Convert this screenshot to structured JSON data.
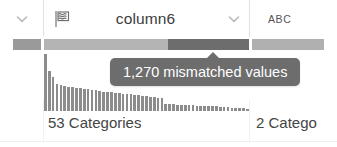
{
  "header": {
    "prev_column": {
      "chevron_icon": "chevron-down-icon"
    },
    "main_column": {
      "type_icon": "flag-text-icon",
      "title": "column6",
      "chevron_icon": "chevron-down-icon"
    },
    "next_column": {
      "type_label": "ABC"
    }
  },
  "quality": {
    "colors": {
      "valid": "#9a9a9a",
      "valid_light": "#b4b4b4",
      "mismatched": "#6d6d6d",
      "neutral": "#a8a8a8"
    },
    "segments": [
      {
        "name": "prev-column-quality",
        "label": "valid",
        "x": 13,
        "width": 28,
        "color": "#9a9a9a"
      },
      {
        "name": "main-column-valid",
        "label": "valid",
        "x": 44,
        "width": 124,
        "color": "#b4b4b4"
      },
      {
        "name": "main-column-mismatched",
        "label": "mismatched",
        "x": 168,
        "width": 81,
        "color": "#6d6d6d"
      },
      {
        "name": "next-column-quality",
        "label": "valid",
        "x": 252,
        "width": 72,
        "color": "#b0b0b0"
      }
    ]
  },
  "tooltip": {
    "text": "1,270 mismatched values"
  },
  "footer": {
    "main_categories": "53 Categories",
    "next_categories": "2 Catego"
  },
  "chart_data": {
    "type": "bar",
    "xlabel": "",
    "ylabel": "count",
    "categories": [
      "c1",
      "c2",
      "c3",
      "c4",
      "c5",
      "c6",
      "c7",
      "c8",
      "c9",
      "c10",
      "c11",
      "c12",
      "c13",
      "c14",
      "c15",
      "c16",
      "c17",
      "c18",
      "c19",
      "c20",
      "c21",
      "c22",
      "c23",
      "c24",
      "c25",
      "c26",
      "c27",
      "c28",
      "c29",
      "c30",
      "c31",
      "c32",
      "c33",
      "c34",
      "c35",
      "c36",
      "c37",
      "c38",
      "c39",
      "c40",
      "c41",
      "c42",
      "c43",
      "c44",
      "c45",
      "c46",
      "c47",
      "c48",
      "c49",
      "c50",
      "c51",
      "c52",
      "c53"
    ],
    "values": [
      100,
      70,
      60,
      48,
      46,
      44,
      43,
      42,
      41,
      40,
      39,
      38,
      37,
      36,
      35,
      34,
      34,
      33,
      32,
      31,
      30,
      30,
      29,
      28,
      28,
      27,
      26,
      25,
      24,
      23,
      22,
      13,
      12,
      12,
      11,
      11,
      10,
      10,
      10,
      9,
      9,
      9,
      8,
      8,
      8,
      7,
      7,
      7,
      6,
      6,
      5,
      5,
      4
    ],
    "bar_color": "#8c8c8c",
    "grid": false,
    "legend": false,
    "ylim": [
      0,
      100
    ]
  }
}
